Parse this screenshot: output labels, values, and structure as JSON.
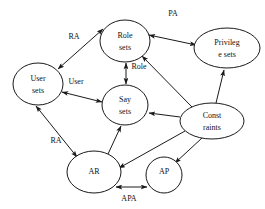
{
  "diagram": {
    "stroke_color": "#1a1a1a",
    "text_color": "#111111",
    "background_color": "#ffffff",
    "nodes": [
      {
        "id": "user-sets",
        "label_lines": [
          "User",
          "sets"
        ],
        "cx": 38,
        "cy": 84,
        "rx": 25,
        "ry": 21
      },
      {
        "id": "role-sets",
        "label_lines": [
          "Role",
          "sets"
        ],
        "cx": 125,
        "cy": 41,
        "rx": 25,
        "ry": 21
      },
      {
        "id": "privilege-sets",
        "label_lines": [
          "Privileg",
          "e sets"
        ],
        "cx": 227,
        "cy": 48,
        "rx": 33,
        "ry": 20
      },
      {
        "id": "say-sets",
        "label_lines": [
          "Say",
          "sets"
        ],
        "cx": 125,
        "cy": 105,
        "rx": 23,
        "ry": 20
      },
      {
        "id": "constraints",
        "label_lines": [
          "Const",
          "raints"
        ],
        "cx": 212,
        "cy": 121,
        "rx": 32,
        "ry": 18
      },
      {
        "id": "ar",
        "label_lines": [
          "AR"
        ],
        "cx": 94,
        "cy": 172,
        "rx": 27,
        "ry": 21
      },
      {
        "id": "ap",
        "label_lines": [
          "AP"
        ],
        "cx": 164,
        "cy": 175,
        "rx": 18,
        "ry": 18
      }
    ],
    "edge_labels": [
      {
        "id": "label-pa",
        "text": "PA",
        "x": 173,
        "y": 14
      },
      {
        "id": "label-ra-top",
        "text": "RA",
        "x": 74,
        "y": 37
      },
      {
        "id": "label-user",
        "text": "User",
        "x": 76,
        "y": 82
      },
      {
        "id": "label-role",
        "text": "Role",
        "x": 139,
        "y": 67
      },
      {
        "id": "label-ra-bottom",
        "text": "RA",
        "x": 56,
        "y": 141
      },
      {
        "id": "label-apa",
        "text": "APA",
        "x": 129,
        "y": 199
      }
    ],
    "edges": [
      {
        "id": "edge-user-role",
        "from": "user-sets",
        "to": "role-sets",
        "label": "RA",
        "arrows": "both"
      },
      {
        "id": "edge-role-privilege",
        "from": "role-sets",
        "to": "privilege-sets",
        "label": "PA",
        "arrows": "both"
      },
      {
        "id": "edge-role-say",
        "from": "role-sets",
        "to": "say-sets",
        "label": "Role",
        "arrows": "both"
      },
      {
        "id": "edge-user-say",
        "from": "user-sets",
        "to": "say-sets",
        "label": "User",
        "arrows": "both"
      },
      {
        "id": "edge-user-ar",
        "from": "user-sets",
        "to": "ar",
        "label": "RA",
        "arrows": "both"
      },
      {
        "id": "edge-ar-ap",
        "from": "ar",
        "to": "ap",
        "label": "APA",
        "arrows": "both"
      },
      {
        "id": "edge-ar-say",
        "from": "ar",
        "to": "say-sets",
        "label": "",
        "arrows": "to"
      },
      {
        "id": "edge-constraints-role",
        "from": "constraints",
        "to": "role-sets",
        "label": "",
        "arrows": "to"
      },
      {
        "id": "edge-constraints-privilege",
        "from": "constraints",
        "to": "privilege-sets",
        "label": "",
        "arrows": "to"
      },
      {
        "id": "edge-constraints-say",
        "from": "constraints",
        "to": "say-sets",
        "label": "",
        "arrows": "to"
      },
      {
        "id": "edge-constraints-ar",
        "from": "constraints",
        "to": "ar",
        "label": "",
        "arrows": "to"
      },
      {
        "id": "edge-constraints-ap",
        "from": "constraints",
        "to": "ap",
        "label": "",
        "arrows": "to"
      }
    ]
  }
}
